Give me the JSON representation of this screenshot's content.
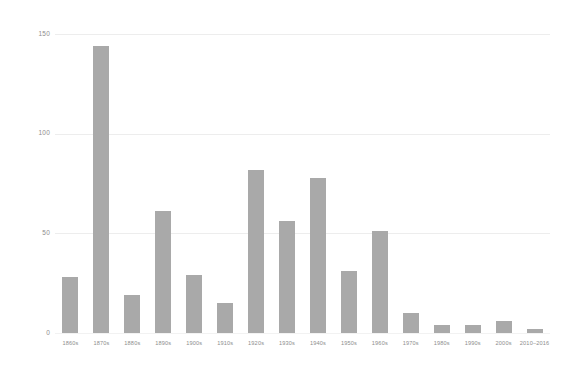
{
  "chart_data": {
    "type": "bar",
    "title": "",
    "subtitle": "",
    "xlabel": "",
    "ylabel": "",
    "categories": [
      "1860s",
      "1870s",
      "1880s",
      "1890s",
      "1900s",
      "1910s",
      "1920s",
      "1930s",
      "1940s",
      "1950s",
      "1960s",
      "1970s",
      "1980s",
      "1990s",
      "2000s",
      "2010–2016"
    ],
    "values": [
      28,
      144,
      19,
      61,
      29,
      15,
      82,
      56,
      78,
      31,
      51,
      10,
      4,
      4,
      6,
      2
    ],
    "ylim": [
      0,
      150
    ],
    "yticks": [
      0,
      50,
      100,
      150
    ],
    "ytick_labels": [
      "0",
      "50",
      "100",
      "150"
    ],
    "grid": true,
    "grid_axis": "y",
    "legend": null,
    "legend_position": "none",
    "bar_color": "#a9a9a9",
    "grid_color": "#ededed",
    "tick_label_color": "#8d8d8d",
    "background_color": "#ffffff"
  }
}
